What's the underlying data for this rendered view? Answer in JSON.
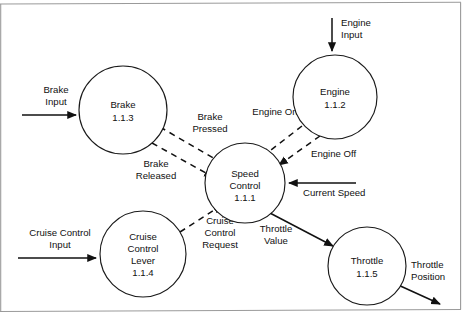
{
  "diagram": {
    "type": "data-flow-diagram",
    "stroke_color": "#111111",
    "frame_color": "#9a9a9a",
    "background": "#ffffff",
    "processes": [
      {
        "id": "brake",
        "name": "Brake",
        "number": "1.1.3",
        "cx": 123,
        "cy": 110,
        "r": 44
      },
      {
        "id": "engine",
        "name": "Engine",
        "number": "1.1.2",
        "cx": 335,
        "cy": 97,
        "r": 42
      },
      {
        "id": "speed_control",
        "name": "Speed Control",
        "name_line1": "Speed",
        "name_line2": "Control",
        "number": "1.1.1",
        "cx": 245,
        "cy": 183,
        "r": 40
      },
      {
        "id": "cruise_control_lever",
        "name": "Cruise Control Lever",
        "name_line1": "Cruise",
        "name_line2": "Control",
        "name_line3": "Lever",
        "number": "1.1.4",
        "cx": 143,
        "cy": 254,
        "r": 43
      },
      {
        "id": "throttle",
        "name": "Throttle",
        "number": "1.1.5",
        "cx": 367,
        "cy": 266,
        "r": 39
      }
    ],
    "flows": [
      {
        "id": "brake_input",
        "label_line1": "Brake",
        "label_line2": "Input",
        "style": "solid",
        "from": "external",
        "to": "brake"
      },
      {
        "id": "engine_input",
        "label_line1": "Engine",
        "label_line2": "Input",
        "style": "solid",
        "from": "external",
        "to": "engine"
      },
      {
        "id": "cruise_control_input",
        "label_line1": "Cruise Control",
        "label_line2": "Input",
        "style": "solid",
        "from": "external",
        "to": "cruise_control_lever"
      },
      {
        "id": "brake_pressed",
        "label_line1": "Brake",
        "label_line2": "Pressed",
        "style": "dashed",
        "from": "brake",
        "to": "speed_control"
      },
      {
        "id": "brake_released",
        "label_line1": "Brake",
        "label_line2": "Released",
        "style": "dashed",
        "from": "brake",
        "to": "speed_control"
      },
      {
        "id": "engine_on",
        "label_line1": "Engine On",
        "style": "dashed",
        "from": "engine",
        "to": "speed_control"
      },
      {
        "id": "engine_off",
        "label_line1": "Engine Off",
        "style": "dashed",
        "from": "engine",
        "to": "speed_control"
      },
      {
        "id": "cruise_control_request",
        "label_line1": "Cruise",
        "label_line2": "Control",
        "label_line3": "Request",
        "style": "dashed",
        "from": "cruise_control_lever",
        "to": "speed_control"
      },
      {
        "id": "current_speed",
        "label_line1": "Current Speed",
        "style": "solid",
        "from": "external",
        "to": "speed_control"
      },
      {
        "id": "throttle_value",
        "label_line1": "Throttle",
        "label_line2": "Value",
        "style": "solid",
        "from": "speed_control",
        "to": "throttle"
      },
      {
        "id": "throttle_position",
        "label_line1": "Throttle",
        "label_line2": "Position",
        "style": "solid",
        "from": "throttle",
        "to": "external"
      }
    ]
  }
}
